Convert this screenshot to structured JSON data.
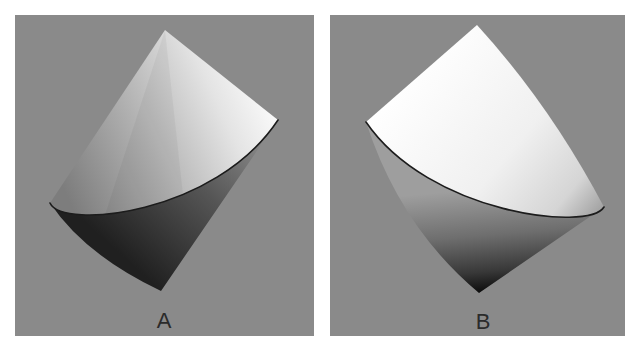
{
  "figure": {
    "page_background": "#ffffff",
    "panel_background": "#8a8a8a",
    "rim_color": "#1c1c1c",
    "label_color": "#2b2b2b",
    "panels": [
      {
        "label": "A",
        "shape": "double-cone",
        "upper_cone_stops": [
          "#7d7d7d",
          "#b2b2b2",
          "#e4e4e4",
          "#fefefe"
        ],
        "lower_cone_stops": [
          "#9b9b9b",
          "#555555",
          "#202020"
        ]
      },
      {
        "label": "B",
        "shape": "double-cone",
        "upper_cone_stops": [
          "#ffffff",
          "#f0f0f0",
          "#d5d5d5",
          "#a2a2a2"
        ],
        "lower_cone_stops": [
          "#9e9e9e",
          "#6e6e6e",
          "#383838",
          "#0b0b0b"
        ]
      }
    ]
  }
}
